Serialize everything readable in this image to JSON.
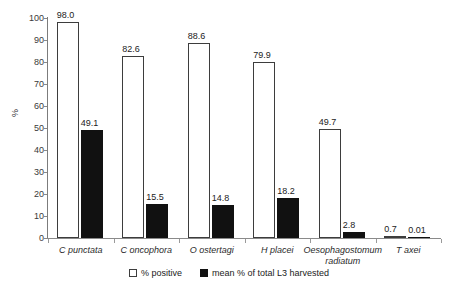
{
  "chart_data": {
    "type": "bar",
    "title": "",
    "subtitle": "",
    "xlabel": "",
    "ylabel": "%",
    "ylim": [
      0,
      100
    ],
    "yticks": [
      0,
      10,
      20,
      30,
      40,
      50,
      60,
      70,
      80,
      90,
      100
    ],
    "grid": false,
    "legend_position": "bottom-center",
    "categories": [
      "C punctata",
      "C oncophora",
      "O ostertagi",
      "H placei",
      "Oesophagostomum radiatum",
      "T axei"
    ],
    "category_lines": [
      [
        "C punctata"
      ],
      [
        "C oncophora"
      ],
      [
        "O ostertagi"
      ],
      [
        "H placei"
      ],
      [
        "Oesophagostomum",
        "radiatum"
      ],
      [
        "T axei"
      ]
    ],
    "series": [
      {
        "name": "% positive",
        "color": "#ffffff",
        "border_color": "#3d3d3d",
        "values": [
          98.0,
          82.6,
          88.6,
          79.9,
          49.7,
          0.7
        ],
        "labels": [
          "98.0",
          "82.6",
          "88.6",
          "79.9",
          "49.7",
          "0.7"
        ]
      },
      {
        "name": "mean % of total L3 harvested",
        "color": "#111111",
        "border_color": "#111111",
        "values": [
          49.1,
          15.5,
          14.8,
          18.2,
          2.8,
          0.01
        ],
        "labels": [
          "49.1",
          "15.5",
          "14.8",
          "18.2",
          "2.8",
          "0.01"
        ]
      }
    ]
  },
  "axis": {
    "y_title": "%",
    "tick_labels": [
      "0",
      "10",
      "20",
      "30",
      "40",
      "50",
      "60",
      "70",
      "80",
      "90",
      "100"
    ]
  },
  "legend": {
    "items": [
      {
        "label": "% positive",
        "swatch": "hollow-square"
      },
      {
        "label": "mean % of total L3 harvested",
        "swatch": "filled-square"
      }
    ]
  }
}
